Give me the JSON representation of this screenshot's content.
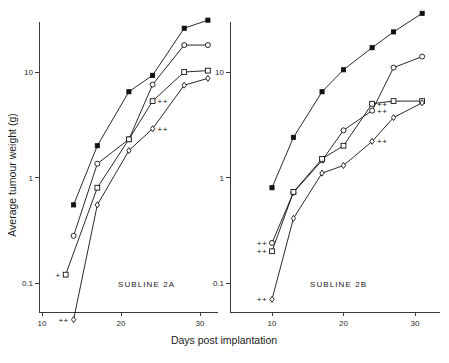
{
  "figure": {
    "xlabel": "Days post implantation",
    "ylabel": "Average tumour weight (g)"
  },
  "panels": {
    "a": {
      "label": "SUBLINE  2A"
    },
    "b": {
      "label": "SUBLINE  2B"
    }
  },
  "axes": {
    "y_ticks": [
      "10",
      "1",
      "0.1"
    ],
    "x_ticks": [
      "10",
      "20",
      "30"
    ]
  },
  "chart_data": [
    {
      "type": "line",
      "title": "SUBLINE 2A",
      "xlabel": "Days post implantation",
      "ylabel": "Average tumour weight (g)",
      "yscale": "log",
      "ylim": [
        0.035,
        45
      ],
      "xlim": [
        8,
        33
      ],
      "ytick_values": [
        10,
        1,
        0.1
      ],
      "xtick_values": [
        10,
        20,
        30
      ],
      "grid": false,
      "legend": "none",
      "series": [
        {
          "name": "filled-square",
          "marker": "filled square",
          "x": [
            14,
            17,
            21,
            24,
            28,
            31
          ],
          "y": [
            0.55,
            2.0,
            6.5,
            9.3,
            26.0,
            31.0
          ],
          "annotations": [
            "",
            "",
            "",
            "",
            "",
            ""
          ]
        },
        {
          "name": "open-circle",
          "marker": "open circle",
          "x": [
            14,
            17,
            21,
            24,
            28,
            31
          ],
          "y": [
            0.28,
            1.35,
            2.3,
            7.6,
            18.0,
            18.0
          ],
          "annotations": [
            "",
            "",
            "",
            "",
            "",
            ""
          ]
        },
        {
          "name": "open-square",
          "marker": "open square",
          "x": [
            13,
            17,
            21,
            24,
            28,
            31
          ],
          "y": [
            0.12,
            0.8,
            2.3,
            5.3,
            10.0,
            10.3
          ],
          "annotations": [
            "+",
            "",
            "",
            "++",
            "",
            ""
          ]
        },
        {
          "name": "open-diamond",
          "marker": "open diamond",
          "x": [
            14,
            17,
            21,
            24,
            28,
            31
          ],
          "y": [
            0.045,
            0.55,
            1.8,
            2.9,
            7.5,
            8.7
          ],
          "annotations": [
            "++",
            "",
            "",
            "++",
            "",
            ""
          ]
        }
      ]
    },
    {
      "type": "line",
      "title": "SUBLINE 2B",
      "xlabel": "Days post implantation",
      "ylabel": "Average tumour weight (g)",
      "yscale": "log",
      "ylim": [
        0.035,
        45
      ],
      "xlim": [
        8,
        33
      ],
      "ytick_values": [
        10,
        1,
        0.1
      ],
      "xtick_values": [
        10,
        20,
        30
      ],
      "grid": false,
      "legend": "none",
      "series": [
        {
          "name": "filled-square",
          "marker": "filled square",
          "x": [
            10,
            13,
            17,
            20,
            24,
            27,
            31
          ],
          "y": [
            0.8,
            2.4,
            6.5,
            10.5,
            17.0,
            24.0,
            36.0
          ],
          "annotations": [
            "",
            "",
            "",
            "",
            "",
            "",
            ""
          ]
        },
        {
          "name": "open-circle",
          "marker": "open circle",
          "x": [
            10,
            13,
            17,
            20,
            24,
            27,
            31
          ],
          "y": [
            0.24,
            0.72,
            1.45,
            2.8,
            4.3,
            11.0,
            14.0
          ],
          "annotations": [
            "++",
            "",
            "",
            "",
            "++",
            "",
            ""
          ]
        },
        {
          "name": "open-square",
          "marker": "open square",
          "x": [
            10,
            13,
            17,
            20,
            24,
            27,
            31
          ],
          "y": [
            0.2,
            0.73,
            1.5,
            2.0,
            5.0,
            5.3,
            5.3
          ],
          "annotations": [
            "++",
            "",
            "",
            "",
            "++",
            "",
            ""
          ]
        },
        {
          "name": "open-diamond",
          "marker": "open diamond",
          "x": [
            10,
            13,
            17,
            20,
            24,
            27,
            31
          ],
          "y": [
            0.07,
            0.41,
            1.1,
            1.3,
            2.2,
            3.7,
            5.1
          ],
          "annotations": [
            "++",
            "",
            "",
            "",
            "++",
            "",
            ""
          ]
        }
      ]
    }
  ]
}
